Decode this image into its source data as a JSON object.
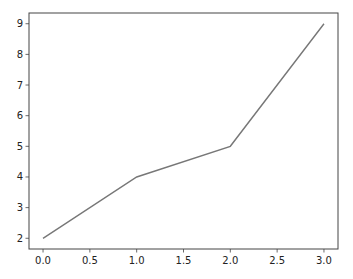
{
  "chart_data": {
    "type": "line",
    "title": "",
    "xlabel": "",
    "ylabel": "",
    "x": [
      0,
      1,
      2,
      3
    ],
    "series": [
      {
        "name": "",
        "values": [
          2,
          4,
          5,
          9
        ],
        "color": "#777777"
      }
    ],
    "xlim": [
      -0.15,
      3.15
    ],
    "ylim": [
      1.65,
      9.35
    ],
    "xticks": [
      0.0,
      0.5,
      1.0,
      1.5,
      2.0,
      2.5,
      3.0
    ],
    "xtick_labels": [
      "0.0",
      "0.5",
      "1.0",
      "1.5",
      "2.0",
      "2.5",
      "3.0"
    ],
    "yticks": [
      2,
      3,
      4,
      5,
      6,
      7,
      8,
      9
    ],
    "ytick_labels": [
      "2",
      "3",
      "4",
      "5",
      "6",
      "7",
      "8",
      "9"
    ],
    "grid": false,
    "legend": null
  },
  "colors": {
    "line": "#777777",
    "axes": "#444444",
    "background": "#ffffff"
  }
}
